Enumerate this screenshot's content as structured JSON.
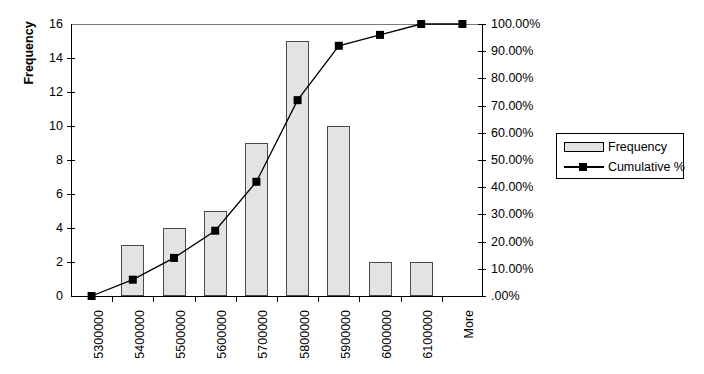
{
  "chart_data": {
    "type": "bar",
    "title": "",
    "subtitle": "",
    "categories": [
      "5300000",
      "5400000",
      "5500000",
      "5600000",
      "5700000",
      "5800000",
      "5900000",
      "6000000",
      "6100000",
      "More"
    ],
    "series": [
      {
        "name": "Frequency",
        "type": "bar",
        "axis": "left",
        "values": [
          0,
          3,
          4,
          5,
          9,
          15,
          10,
          2,
          2,
          0
        ]
      },
      {
        "name": "Cumulative %",
        "type": "line",
        "axis": "right",
        "values": [
          0,
          6,
          14,
          24,
          42,
          72,
          92,
          96,
          100,
          100
        ],
        "value_labels": [
          ".00%",
          "6.00%",
          "14.00%",
          "24.00%",
          "42.00%",
          "72.00%",
          "92.00%",
          "96.00%",
          "100.00%",
          "100.00%"
        ]
      }
    ],
    "xlabel": "",
    "ylabel": "Frequency",
    "ylabel_right": "",
    "ylim": [
      0,
      16
    ],
    "ylim_right": [
      0,
      100
    ],
    "yticks": [
      0,
      2,
      4,
      6,
      8,
      10,
      12,
      14,
      16
    ],
    "ytick_labels": [
      "0",
      "2",
      "4",
      "6",
      "8",
      "10",
      "12",
      "14",
      "16"
    ],
    "yticks_right": [
      0,
      10,
      20,
      30,
      40,
      50,
      60,
      70,
      80,
      90,
      100
    ],
    "ytick_labels_right": [
      ".00%",
      "10.00%",
      "20.00%",
      "30.00%",
      "40.00%",
      "50.00%",
      "60.00%",
      "70.00%",
      "80.00%",
      "90.00%",
      "100.00%"
    ],
    "grid": false,
    "legend_position": "right",
    "legend": [
      "Frequency",
      "Cumulative %"
    ],
    "colors": {
      "bar_fill": "#e3e3e3",
      "bar_border": "#4a4a4a",
      "line": "#000000",
      "marker": "#000000",
      "axis": "#000000",
      "top_line": "#7b7b7b",
      "background": "#ffffff"
    }
  },
  "axes": {
    "left_title": "Frequency"
  },
  "legend": {
    "items": [
      {
        "label": "Frequency",
        "marker": "bar-swatch"
      },
      {
        "label": "Cumulative %",
        "marker": "line-square-swatch"
      }
    ]
  }
}
